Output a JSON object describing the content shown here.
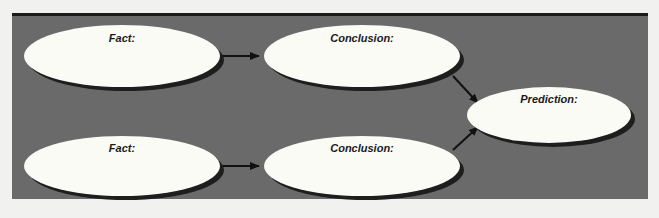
{
  "diagram": {
    "type": "flow",
    "background_color": "#6a6a6a",
    "node_fill": "#fbfbf6",
    "shadow_color": "#1e1e1e",
    "nodes": [
      {
        "id": "fact1",
        "label": "Fact:",
        "cx": 122,
        "cy": 56,
        "rx": 98,
        "ry": 31,
        "label_y": 32
      },
      {
        "id": "conclusion1",
        "label": "Conclusion:",
        "cx": 362,
        "cy": 56,
        "rx": 98,
        "ry": 31,
        "label_y": 32
      },
      {
        "id": "prediction",
        "label": "Prediction:",
        "cx": 549,
        "cy": 115,
        "rx": 82,
        "ry": 28,
        "label_y": 93
      },
      {
        "id": "fact2",
        "label": "Fact:",
        "cx": 122,
        "cy": 166,
        "rx": 98,
        "ry": 30,
        "label_y": 142
      },
      {
        "id": "conclusion2",
        "label": "Conclusion:",
        "cx": 362,
        "cy": 166,
        "rx": 98,
        "ry": 30,
        "label_y": 142
      }
    ],
    "edges": [
      {
        "from": "fact1",
        "to": "conclusion1"
      },
      {
        "from": "fact2",
        "to": "conclusion2"
      },
      {
        "from": "conclusion1",
        "to": "prediction"
      },
      {
        "from": "conclusion2",
        "to": "prediction"
      }
    ]
  }
}
